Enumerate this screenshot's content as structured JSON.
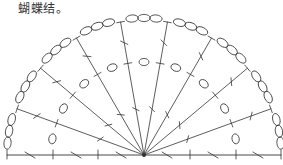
{
  "caption": "蝴蝶结。",
  "diagram": {
    "type": "crochet-chart-semicircle",
    "center": [
      144,
      155
    ],
    "outer_radius": 139,
    "inner_radius": 93,
    "ray_angles_deg": [
      160,
      140,
      120,
      100,
      80,
      60,
      40,
      20
    ],
    "baseline": {
      "x1": 7,
      "x2": 281,
      "y": 155
    },
    "outer_chain_ovals_per_gap": 3,
    "inner_oval_count": 9,
    "stroke_color": "#333333",
    "background": "#ffffff"
  }
}
